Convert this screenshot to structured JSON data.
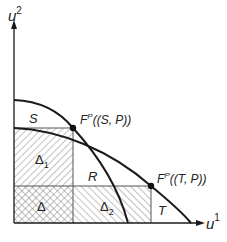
{
  "figure": {
    "axes": {
      "x_label": "u",
      "x_sup": "1",
      "y_label": "u",
      "y_sup": "2"
    },
    "regions": {
      "S": "S",
      "R": "R",
      "T": "T",
      "delta": "Δ",
      "delta1": "Δ",
      "delta1_sub": "1",
      "delta2": "Δ",
      "delta2_sub": "2"
    },
    "points": {
      "sp": {
        "label_main": "F",
        "label_sup": "P",
        "label_args": "((S, P))"
      },
      "tp": {
        "label_main": "F",
        "label_sup": "P",
        "label_args": "((T, P))"
      }
    },
    "colors": {
      "line": "#1a1a1a",
      "hatch": "#555555",
      "background": "#ffffff"
    }
  }
}
